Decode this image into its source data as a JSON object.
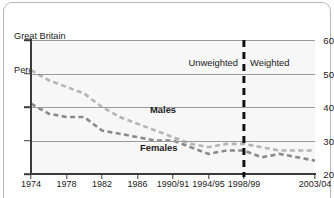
{
  "header": {
    "region": "Great Britain",
    "units": "Percentages"
  },
  "annotations": {
    "unweighted": "Unweighted",
    "weighted": "Weighted",
    "divider_at": "1998/99"
  },
  "colors": {
    "males_line": "#b5b5b5",
    "females_line": "#8a8a8a",
    "axis": "#3b3b3b",
    "grid": "#9b9b9b",
    "plot_background": "#f7f7f7",
    "frame_border": "#b9b9b9",
    "text": "#1b1b1b",
    "divider": "#121212"
  },
  "chart_data": {
    "type": "line",
    "title": "",
    "subtitle": "",
    "xlabel": "",
    "ylabel": "Percentages",
    "ylim": [
      20,
      60
    ],
    "yticks": [
      20,
      30,
      40,
      50,
      60
    ],
    "grid": true,
    "legend": "inline-labels",
    "categories": [
      "1974",
      "1976",
      "1978",
      "1980",
      "1982",
      "1984",
      "1986",
      "1988",
      "1990/91",
      "1992/93",
      "1994/95",
      "1996/97",
      "1998/99",
      "2000/01",
      "2001/02",
      "2002/03",
      "2003/04"
    ],
    "xticks": [
      "1974",
      "1978",
      "1982",
      "1986",
      "1990/91",
      "1994/95",
      "1998/99",
      "2003/04"
    ],
    "series": [
      {
        "name": "Males",
        "label": "Males",
        "style": "dashed",
        "color": "#b5b5b5",
        "values": [
          51,
          48,
          46,
          44,
          40,
          37,
          35,
          33,
          31,
          29,
          28,
          29,
          29,
          28,
          27,
          27,
          27
        ]
      },
      {
        "name": "Females",
        "label": "Females",
        "style": "dashed",
        "color": "#8a8a8a",
        "values": [
          41,
          38,
          37,
          37,
          33,
          32,
          31,
          30,
          30,
          28,
          26,
          27,
          27,
          25,
          26,
          25,
          24
        ]
      }
    ]
  }
}
